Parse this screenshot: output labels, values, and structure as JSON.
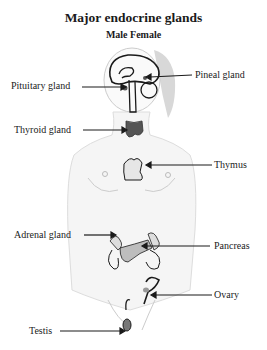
{
  "title": "Major endocrine glands",
  "subtitle": "Male Female",
  "labels": {
    "pituitary": "Pituitary gland",
    "pineal": "Pineal gland",
    "thyroid": "Thyroid gland",
    "thymus": "Thymus",
    "adrenal": "Adrenal gland",
    "pancreas": "Pancreas",
    "ovary": "Ovary",
    "testis": "Testis"
  },
  "colors": {
    "outline": "#1a1a1a",
    "body_fill": "#f4f4f4",
    "hair": "#d4d4d4",
    "thyroid": "#555555",
    "pancreas": "#bdbdbd"
  }
}
